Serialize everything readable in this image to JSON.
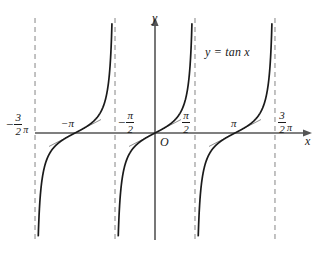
{
  "figure": {
    "title_label": "y = tan x",
    "background_color": "#ffffff",
    "curve_color": "#1a1a1a",
    "axis_color": "#555555",
    "asymptote_color": "#9a9a9a",
    "tangent_color": "#8d8d8d"
  },
  "axes": {
    "x_axis_name": "x",
    "y_axis_name": "y",
    "origin_label": "O"
  },
  "ticks": {
    "neg_three_half_pi": {
      "sign": "−",
      "numerator": "3",
      "denominator": "2",
      "pi": "π"
    },
    "neg_pi": "−π",
    "neg_half_pi": {
      "sign": "−",
      "numerator": "π",
      "denominator": "2",
      "pi": ""
    },
    "half_pi": {
      "sign": "",
      "numerator": "π",
      "denominator": "2",
      "pi": ""
    },
    "pi": "π",
    "three_half_pi": {
      "sign": "",
      "numerator": "3",
      "denominator": "2",
      "pi": "π"
    }
  },
  "chart_data": {
    "type": "line",
    "title": "y = tan x",
    "xlabel": "x",
    "ylabel": "y",
    "function": "y = tan(x)",
    "grid": false,
    "legend": "none",
    "xlim": [
      -5.4978,
      5.4978
    ],
    "ylim": [
      -8.0,
      8.0
    ],
    "xtick_values": [
      -4.7124,
      -3.1416,
      -1.5708,
      0,
      1.5708,
      3.1416,
      4.7124
    ],
    "xtick_labels": [
      "-3/2 π",
      "-π",
      "-π/2",
      "O",
      "π/2",
      "π",
      "3/2 π"
    ],
    "asymptotes": [
      -4.7124,
      -1.5708,
      1.5708,
      4.7124
    ],
    "zero_crossings": [
      -3.1416,
      0,
      3.1416
    ],
    "branches": [
      {
        "x_range": [
          -4.7124,
          -1.5708
        ],
        "center": -3.1416
      },
      {
        "x_range": [
          -1.5708,
          1.5708
        ],
        "center": 0
      },
      {
        "x_range": [
          1.5708,
          4.7124
        ],
        "center": 3.1416
      }
    ],
    "annotations": [
      {
        "text": "y = tan x",
        "x": 3.6,
        "y": 5.4
      },
      {
        "text": "O",
        "x": 0.2,
        "y": -0.75
      }
    ],
    "tangent_marks": [
      {
        "at_x": -3.1416,
        "note": "short tangent segment at inflection"
      },
      {
        "at_x": 0,
        "note": "short tangent segment at inflection"
      },
      {
        "at_x": 3.1416,
        "note": "short tangent segment at inflection"
      }
    ]
  },
  "geometry": {
    "x_axis_y": 133,
    "y_axis_x": 155,
    "px_per_unit_x": 25.46,
    "px_per_unit_y": 13.2,
    "curve_top": 22,
    "curve_bottom": 240,
    "asymptote_x": [
      35,
      115,
      195,
      275
    ],
    "asymptote_top": 18,
    "asymptote_bottom": 243
  }
}
